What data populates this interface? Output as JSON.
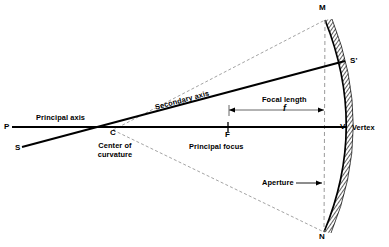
{
  "diagram": {
    "type": "optics-ray-diagram",
    "background": "#ffffff",
    "ink": "#000000",
    "points": {
      "P": {
        "label": "P",
        "x": 8,
        "y": 127,
        "desc": "left end of principal axis"
      },
      "S": {
        "label": "S",
        "x": 18,
        "y": 148,
        "desc": "left end of secondary axis"
      },
      "C": {
        "label": "C",
        "x": 113,
        "y": 133,
        "desc": "center of curvature"
      },
      "F": {
        "label": "F",
        "x": 228,
        "y": 136,
        "desc": "principal focus"
      },
      "V": {
        "label": "V",
        "x": 344,
        "y": 128,
        "desc": "vertex"
      },
      "M": {
        "label": "M",
        "x": 322,
        "y": 8,
        "desc": "top edge of mirror"
      },
      "N": {
        "label": "N",
        "x": 322,
        "y": 236,
        "desc": "bottom edge of mirror"
      },
      "Sprime": {
        "label": "S'",
        "x": 353,
        "y": 62,
        "desc": "secondary axis meets mirror"
      }
    },
    "labels": {
      "principal_axis": "Principal axis",
      "secondary_axis": "Secondary axis",
      "center_of_curvature_line1": "Center of",
      "center_of_curvature_line2": "curvature",
      "principal_focus": "Principal focus",
      "focal_length": "Focal length",
      "focal_length_symbol": "f",
      "aperture": "Aperture",
      "vertex": "Vertex"
    },
    "geometry": {
      "principal_axis": {
        "x1": 12,
        "y1": 127,
        "x2": 346,
        "y2": 127
      },
      "secondary_axis": {
        "x1": 22,
        "y1": 147,
        "x2": 344,
        "y2": 62
      },
      "dashed_C_to_M": {
        "x1": 113,
        "y1": 130,
        "x2": 325,
        "y2": 20
      },
      "dashed_C_to_N": {
        "x1": 113,
        "y1": 130,
        "x2": 324,
        "y2": 232
      },
      "aperture_line": {
        "x1": 325,
        "y1": 20,
        "x2": 324,
        "y2": 232
      },
      "mirror_arc": {
        "top": [
          325,
          20
        ],
        "vertex": [
          346,
          127
        ],
        "bottom": [
          324,
          232
        ],
        "band_thickness": 7,
        "hatched": true
      },
      "focal_length_arrow": {
        "x1": 229,
        "y1": 110,
        "x2": 325,
        "y2": 110
      },
      "aperture_arrow": {
        "x1": 296,
        "y1": 183,
        "x2": 322,
        "y2": 183
      }
    }
  }
}
